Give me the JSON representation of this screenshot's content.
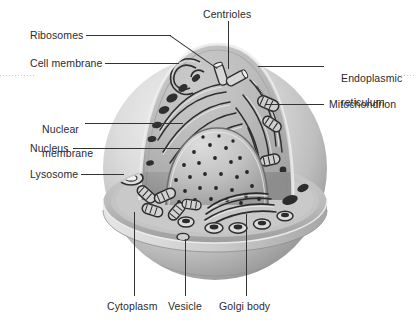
{
  "figure": {
    "background_color": "#ffffff",
    "text_color": "#2b2b2b",
    "leader_color": "#333333",
    "artwork_tones": {
      "outer_sphere_light": "#e8e8e8",
      "outer_sphere_mid": "#c2c2c2",
      "outer_sphere_dark": "#9a9a9a",
      "cut_face": "#b4b4b4",
      "nucleus": "#c8c8c8",
      "organelle_dark": "#3a3a3a",
      "organelle_light": "#efefef"
    }
  },
  "labels": {
    "centrioles": "Centrioles",
    "ribosomes": "Ribosomes",
    "cell_membrane": "Cell membrane",
    "nuclear_membrane_line1": "Nuclear",
    "nuclear_membrane_line2": "membrane",
    "nucleus": "Nucleus",
    "lysosome": "Lysosome",
    "endoplasmic_reticulum_line1": "Endoplasmic",
    "endoplasmic_reticulum_line2": "reticulum",
    "mitochondrion": "Mitochondrion",
    "cytoplasm": "Cytoplasm",
    "vesicle": "Vesicle",
    "golgi_body": "Golgi body"
  },
  "structures": [
    {
      "name": "centrioles",
      "label": "Centrioles",
      "side": "top"
    },
    {
      "name": "ribosomes",
      "label": "Ribosomes",
      "side": "left"
    },
    {
      "name": "cell-membrane",
      "label": "Cell membrane",
      "side": "left"
    },
    {
      "name": "nuclear-membrane",
      "label": "Nuclear membrane",
      "side": "left"
    },
    {
      "name": "nucleus",
      "label": "Nucleus",
      "side": "left"
    },
    {
      "name": "lysosome",
      "label": "Lysosome",
      "side": "left"
    },
    {
      "name": "endoplasmic-reticulum",
      "label": "Endoplasmic reticulum",
      "side": "right"
    },
    {
      "name": "mitochondrion",
      "label": "Mitochondrion",
      "side": "right"
    },
    {
      "name": "cytoplasm",
      "label": "Cytoplasm",
      "side": "bottom"
    },
    {
      "name": "vesicle",
      "label": "Vesicle",
      "side": "bottom"
    },
    {
      "name": "golgi-body",
      "label": "Golgi body",
      "side": "bottom"
    }
  ]
}
